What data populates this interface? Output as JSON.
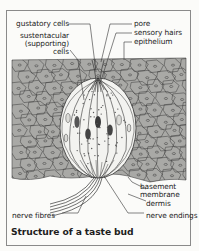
{
  "diagram": {
    "title": "Structure of a taste bud",
    "labels": {
      "gustatory_cells": "gustatory cells",
      "sustentacular_line1": "sustentacular",
      "sustentacular_line2": "(supporting)",
      "sustentacular_line3": "cells",
      "pore": "pore",
      "sensory_hairs": "sensory hairs",
      "epithelium": "epithelium",
      "basement_line1": "basement",
      "basement_line2": "membrane",
      "dermis": "dermis",
      "nerve_fibres": "nerve fibres",
      "nerve_endings": "nerve endings"
    },
    "colors": {
      "epithelium_fill": "#a9a9a6",
      "cell_line": "#3a3a3a",
      "bud_fill": "#f2f2ef",
      "frame": "#8a8a8a",
      "text": "#222222"
    }
  }
}
